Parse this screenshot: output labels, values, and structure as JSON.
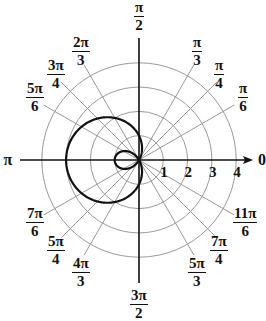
{
  "chart_data": {
    "type": "line",
    "subtype": "polar",
    "title": "",
    "equation": "r = 1 - 2cos(θ)",
    "curve_name": "limaçon with inner loop",
    "radial_ticks": [
      "1",
      "2",
      "3",
      "4"
    ],
    "radial_range": [
      0,
      4
    ],
    "angle_labels": [
      {
        "angle_deg": 0,
        "num": "0",
        "den": ""
      },
      {
        "angle_deg": 30,
        "num": "π",
        "den": "6"
      },
      {
        "angle_deg": 45,
        "num": "π",
        "den": "4"
      },
      {
        "angle_deg": 60,
        "num": "π",
        "den": "3"
      },
      {
        "angle_deg": 90,
        "num": "π",
        "den": "2"
      },
      {
        "angle_deg": 120,
        "num": "2π",
        "den": "3"
      },
      {
        "angle_deg": 135,
        "num": "3π",
        "den": "4"
      },
      {
        "angle_deg": 150,
        "num": "5π",
        "den": "6"
      },
      {
        "angle_deg": 180,
        "num": "π",
        "den": ""
      },
      {
        "angle_deg": 210,
        "num": "7π",
        "den": "6"
      },
      {
        "angle_deg": 225,
        "num": "5π",
        "den": "4"
      },
      {
        "angle_deg": 240,
        "num": "4π",
        "den": "3"
      },
      {
        "angle_deg": 270,
        "num": "3π",
        "den": "2"
      },
      {
        "angle_deg": 300,
        "num": "5π",
        "den": "3"
      },
      {
        "angle_deg": 315,
        "num": "7π",
        "den": "4"
      },
      {
        "angle_deg": 330,
        "num": "11π",
        "den": "6"
      }
    ],
    "key_points": [
      {
        "theta": "0",
        "r": -1
      },
      {
        "theta": "π/3",
        "r": 0
      },
      {
        "theta": "π/2",
        "r": 1
      },
      {
        "theta": "2π/3",
        "r": 2
      },
      {
        "theta": "π",
        "r": 3
      },
      {
        "theta": "4π/3",
        "r": 2
      },
      {
        "theta": "3π/2",
        "r": 1
      },
      {
        "theta": "5π/3",
        "r": 0
      }
    ],
    "grid": true,
    "legend": "none"
  },
  "colors": {
    "grid": "#9a9a9a",
    "axis": "#111111",
    "curve": "#111111",
    "background": "#ffffff"
  }
}
